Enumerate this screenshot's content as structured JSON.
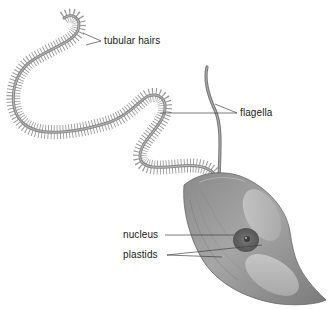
{
  "diagram": {
    "labels": {
      "tubular_hairs": "tubular hairs",
      "flagella": "flagella",
      "nucleus": "nucleus",
      "plastids": "plastids"
    },
    "colors": {
      "background": "#ffffff",
      "flagellum": "#8a8a8a",
      "hairs": "#9a9a9a",
      "cell_body": "#9e9e9e",
      "cell_shadow": "#6e6e6e",
      "plastid": "#c4c4c4",
      "nucleus": "#5e5e5e",
      "leader_line": "#444444",
      "label_text": "#222222"
    }
  }
}
